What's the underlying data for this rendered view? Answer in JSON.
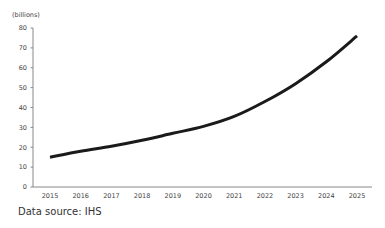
{
  "chart_data": {
    "type": "line",
    "title": "",
    "unit_label": "(billions)",
    "xlabel": "",
    "ylabel": "(billions)",
    "x": [
      2015,
      2016,
      2017,
      2018,
      2019,
      2020,
      2021,
      2022,
      2023,
      2024,
      2025
    ],
    "categories": [
      "2015",
      "2016",
      "2017",
      "2018",
      "2019",
      "2020",
      "2021",
      "2022",
      "2023",
      "2024",
      "2025"
    ],
    "series": [
      {
        "name": "Value",
        "values": [
          15,
          18,
          20.5,
          23.5,
          27,
          30.5,
          35.5,
          43,
          52,
          63,
          76
        ]
      }
    ],
    "ylim": [
      0,
      80
    ],
    "yticks": [
      0,
      10,
      20,
      30,
      40,
      50,
      60,
      70,
      80
    ],
    "grid": false,
    "legend": null,
    "line_color": "#1a1a1a",
    "axis_color": "#888888"
  },
  "footer": {
    "source_text": "Data source: IHS"
  }
}
